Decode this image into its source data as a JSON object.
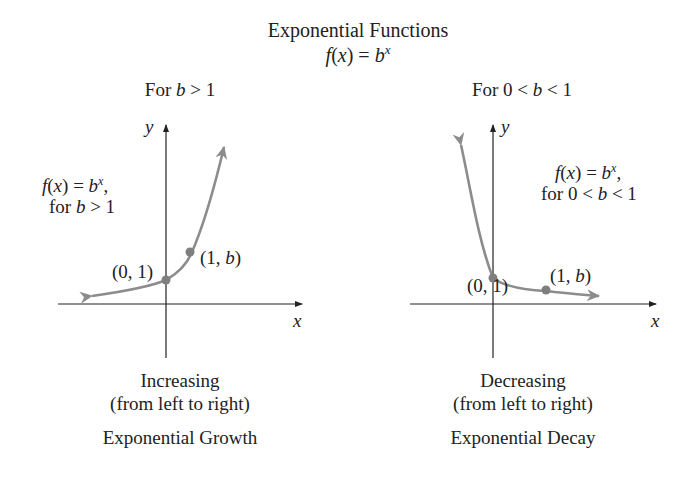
{
  "header": {
    "title": "Exponential Functions",
    "formula": {
      "lhs_fn": "f",
      "lhs_var": "x",
      "equals": " = ",
      "base": "b",
      "exp": "x"
    }
  },
  "panels": [
    {
      "subtitle": {
        "prefix": "For ",
        "var": "b",
        "cond": " > 1"
      },
      "axis_x": "x",
      "axis_y": "y",
      "curve_label": {
        "line1_fn": "f",
        "line1_var": "x",
        "line1_eq": " = ",
        "line1_base": "b",
        "line1_exp": "x",
        "line1_end": ",",
        "line2_prefix": "for ",
        "line2_var": "b",
        "line2_cond": " > 1"
      },
      "point_a": "(0, 1)",
      "point_b": {
        "open": "(1, ",
        "var": "b",
        "close": ")"
      },
      "caption_1": "Increasing",
      "caption_2": "(from left to right)",
      "caption_3": "Exponential Growth"
    },
    {
      "subtitle": {
        "prefix": "For 0 < ",
        "var": "b",
        "cond": " < 1"
      },
      "axis_x": "x",
      "axis_y": "y",
      "curve_label": {
        "line1_fn": "f",
        "line1_var": "x",
        "line1_eq": " = ",
        "line1_base": "b",
        "line1_exp": "x",
        "line1_end": ",",
        "line2_prefix": "for 0 < ",
        "line2_var": "b",
        "line2_cond": " < 1"
      },
      "point_a": "(0, 1)",
      "point_b": {
        "open": "(1, ",
        "var": "b",
        "close": ")"
      },
      "caption_1": "Decreasing",
      "caption_2": "(from left to right)",
      "caption_3": "Exponential Decay"
    }
  ],
  "colors": {
    "curve": "#8c8c8c",
    "axis": "#222222",
    "point": "#7f7f7f",
    "text": "#222222"
  }
}
